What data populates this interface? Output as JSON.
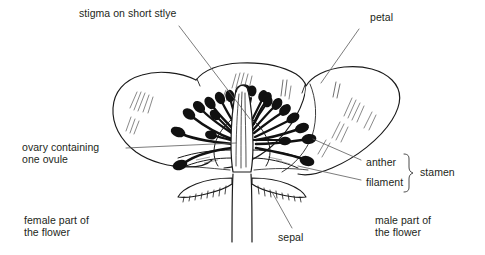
{
  "diagram": {
    "style": "black-and-white line drawing",
    "colors": {
      "ink": "#1a1a1a",
      "text": "#231f20",
      "leader_line": "#5a5a5a",
      "background": "#ffffff"
    }
  },
  "labels": {
    "stigma": "stigma on short stlye",
    "petal": "petal",
    "ovary_line1": "ovary containing",
    "ovary_line2": "one ovule",
    "anther": "anther",
    "filament": "filament",
    "stamen": "stamen",
    "sepal": "sepal",
    "female_line1": "female part of",
    "female_line2": "the flower",
    "male_line1": "male part of",
    "male_line2": "the flower"
  },
  "parts": [
    {
      "name": "stigma",
      "label": "stigma on short stlye",
      "side": "center"
    },
    {
      "name": "petal",
      "label": "petal",
      "side": "right"
    },
    {
      "name": "ovary",
      "label": "ovary containing one ovule",
      "side": "left"
    },
    {
      "name": "anther",
      "label": "anther",
      "side": "right"
    },
    {
      "name": "filament",
      "label": "filament",
      "side": "right"
    },
    {
      "name": "stamen",
      "label": "stamen",
      "side": "right"
    },
    {
      "name": "sepal",
      "label": "sepal",
      "side": "bottom"
    }
  ],
  "regions": [
    {
      "name": "female-part",
      "label": "female part of the flower",
      "side": "left"
    },
    {
      "name": "male-part",
      "label": "male part of the flower",
      "side": "right"
    }
  ],
  "counts": {
    "stamens": 21,
    "petal_lobes": 3,
    "sepals": 2
  }
}
